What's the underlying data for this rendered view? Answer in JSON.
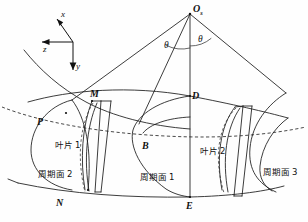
{
  "figure": {
    "apex_label": "O",
    "apex_subscript": "s",
    "angle_left_label": "θ",
    "angle_right_label": "θ",
    "axes": {
      "x_label": "x",
      "y_label": "y",
      "z_label": "z"
    },
    "points": {
      "M": "M",
      "P": "P",
      "B": "B",
      "D": "D",
      "N": "N",
      "E": "E"
    },
    "blades": [
      {
        "id": "blade-1",
        "label": "叶片 1"
      },
      {
        "id": "blade-2",
        "label": "叶片 2"
      }
    ],
    "periodic_surfaces": [
      {
        "id": "periodic-surface-2",
        "label": "周期面 2"
      },
      {
        "id": "periodic-surface-1",
        "label": "周期面 1"
      },
      {
        "id": "periodic-surface-3",
        "label": "周期面 3"
      }
    ],
    "colors": {
      "line": "#1a1a1a",
      "background": "#ffffff"
    }
  }
}
